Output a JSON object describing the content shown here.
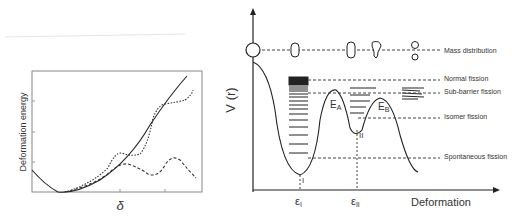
{
  "left_plot": {
    "ylabel": "Deformation energy",
    "xlabel": "δ",
    "curves": [
      "solid",
      "dotted",
      "dashed"
    ]
  },
  "right_plot": {
    "ylabel": "V (r)",
    "xlabel": "Deformation",
    "barrier_labels": {
      "ea": "E",
      "ea_sub": "A",
      "eb": "E",
      "eb_sub": "B"
    },
    "well_labels": {
      "first": "I",
      "second": "II"
    },
    "x_ticks": {
      "e1": "ε",
      "e1_sub": "I",
      "e2": "ε",
      "e2_sub": "II"
    },
    "annotations": [
      "Mass distribution",
      "Normal fission",
      "Sub-barrier fission",
      "Isomer fission",
      "Spontaneous fission"
    ]
  }
}
